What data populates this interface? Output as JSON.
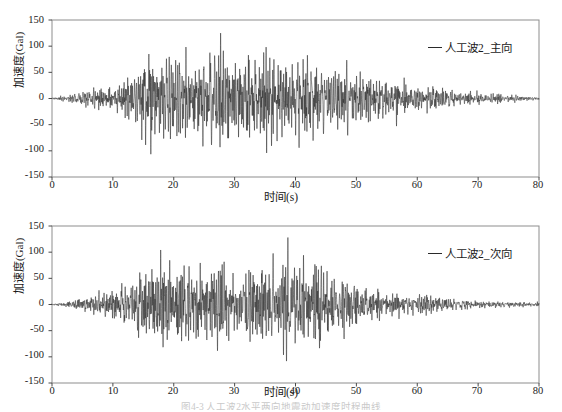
{
  "figure": {
    "caption_fragment": "图4-3  人工波2水平两向地震动加速度时程曲线"
  },
  "panels": [
    {
      "id": "top",
      "legend_label": "人工波2_主向",
      "ylabel": "加速度(Gal)",
      "xlabel": "时间(s)",
      "yticks": [
        "150",
        "100",
        "50",
        "0",
        "-50",
        "-100",
        "-150"
      ],
      "xticks": [
        "0",
        "10",
        "20",
        "30",
        "40",
        "50",
        "60",
        "70",
        "80"
      ]
    },
    {
      "id": "bottom",
      "legend_label": "人工波2_次向",
      "ylabel": "加速度(Gal)",
      "xlabel": "时间(s)",
      "yticks": [
        "150",
        "100",
        "50",
        "0",
        "-50",
        "-100",
        "-150"
      ],
      "xticks": [
        "0",
        "10",
        "20",
        "30",
        "40",
        "50",
        "60",
        "70",
        "80"
      ]
    }
  ],
  "chart_data": [
    {
      "type": "line",
      "id": "artificial-wave-2-main",
      "title": "",
      "xlabel": "时间(s)",
      "ylabel": "加速度(Gal)",
      "xlim": [
        0,
        80
      ],
      "ylim": [
        -150,
        150
      ],
      "xticks": [
        0,
        10,
        20,
        30,
        40,
        50,
        60,
        70,
        80
      ],
      "yticks": [
        -150,
        -100,
        -50,
        0,
        50,
        100,
        150
      ],
      "grid": false,
      "legend_position": "top-right",
      "series": [
        {
          "name": "人工波2_主向",
          "color": "#2a2a2a",
          "description": "Artificial earthquake ground-motion acceleration time history, main (primary) horizontal direction. Non-stationary stochastic signal, duration 80 s.",
          "peak_positive": 125,
          "peak_negative": -120,
          "peak_time": 16.0,
          "envelope_control_points": [
            {
              "t": 0,
              "a": 2
            },
            {
              "t": 2,
              "a": 6
            },
            {
              "t": 5,
              "a": 14
            },
            {
              "t": 8,
              "a": 24
            },
            {
              "t": 11,
              "a": 34
            },
            {
              "t": 14,
              "a": 66
            },
            {
              "t": 16,
              "a": 118
            },
            {
              "t": 18,
              "a": 96
            },
            {
              "t": 20,
              "a": 100
            },
            {
              "t": 23,
              "a": 92
            },
            {
              "t": 26,
              "a": 104
            },
            {
              "t": 29,
              "a": 92
            },
            {
              "t": 32,
              "a": 96
            },
            {
              "t": 35,
              "a": 108
            },
            {
              "t": 38,
              "a": 94
            },
            {
              "t": 41,
              "a": 112
            },
            {
              "t": 44,
              "a": 88
            },
            {
              "t": 47,
              "a": 70
            },
            {
              "t": 50,
              "a": 62
            },
            {
              "t": 53,
              "a": 46
            },
            {
              "t": 56,
              "a": 40
            },
            {
              "t": 60,
              "a": 30
            },
            {
              "t": 64,
              "a": 22
            },
            {
              "t": 68,
              "a": 16
            },
            {
              "t": 72,
              "a": 12
            },
            {
              "t": 76,
              "a": 8
            },
            {
              "t": 80,
              "a": 4
            }
          ]
        }
      ]
    },
    {
      "type": "line",
      "id": "artificial-wave-2-secondary",
      "title": "",
      "xlabel": "时间(s)",
      "ylabel": "加速度(Gal)",
      "xlim": [
        0,
        80
      ],
      "ylim": [
        -150,
        150
      ],
      "xticks": [
        0,
        10,
        20,
        30,
        40,
        50,
        60,
        70,
        80
      ],
      "yticks": [
        -150,
        -100,
        -50,
        0,
        50,
        100,
        150
      ],
      "grid": false,
      "legend_position": "top-right",
      "series": [
        {
          "name": "人工波2_次向",
          "color": "#2a2a2a",
          "description": "Artificial earthquake ground-motion acceleration time history, secondary horizontal direction. Non-stationary stochastic signal, duration 80 s.",
          "peak_positive": 118,
          "peak_negative": -128,
          "peak_time": 31.0,
          "envelope_control_points": [
            {
              "t": 0,
              "a": 2
            },
            {
              "t": 3,
              "a": 8
            },
            {
              "t": 6,
              "a": 18
            },
            {
              "t": 8,
              "a": 30
            },
            {
              "t": 10,
              "a": 36
            },
            {
              "t": 12,
              "a": 52
            },
            {
              "t": 15,
              "a": 108
            },
            {
              "t": 17,
              "a": 96
            },
            {
              "t": 20,
              "a": 90
            },
            {
              "t": 23,
              "a": 88
            },
            {
              "t": 26,
              "a": 92
            },
            {
              "t": 28,
              "a": 100
            },
            {
              "t": 31,
              "a": 114
            },
            {
              "t": 34,
              "a": 94
            },
            {
              "t": 37,
              "a": 96
            },
            {
              "t": 39,
              "a": 120
            },
            {
              "t": 42,
              "a": 92
            },
            {
              "t": 45,
              "a": 104
            },
            {
              "t": 47,
              "a": 70
            },
            {
              "t": 50,
              "a": 58
            },
            {
              "t": 53,
              "a": 40
            },
            {
              "t": 56,
              "a": 32
            },
            {
              "t": 60,
              "a": 24
            },
            {
              "t": 63,
              "a": 20
            },
            {
              "t": 66,
              "a": 14
            },
            {
              "t": 70,
              "a": 10
            },
            {
              "t": 74,
              "a": 8
            },
            {
              "t": 77,
              "a": 6
            },
            {
              "t": 80,
              "a": 4
            }
          ]
        }
      ]
    }
  ]
}
